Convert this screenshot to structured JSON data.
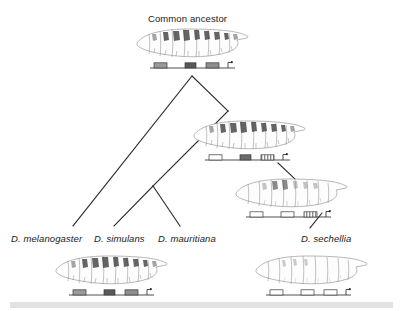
{
  "figure": {
    "kind": "phylogenetic-tree-with-larvae",
    "background_color": "#ffffff",
    "line_color": "#2b2b2b",
    "text_color": "#1a1a1a"
  },
  "title": {
    "text": "Common ancestor",
    "x": 148,
    "y": 14
  },
  "species_labels": [
    {
      "id": "melanogaster",
      "text": "D. melanogaster",
      "x": 11,
      "y": 234
    },
    {
      "id": "simulans",
      "text": "D. simulans",
      "x": 94,
      "y": 234
    },
    {
      "id": "mauritiana",
      "text": "D. mauritiana",
      "x": 158,
      "y": 234
    },
    {
      "id": "sechellia",
      "text": "D. sechellia",
      "x": 301,
      "y": 234
    }
  ],
  "tree": {
    "nodes": {
      "root": {
        "x": 192,
        "y": 76
      },
      "node_right": {
        "x": 228,
        "y": 111
      },
      "node_inner": {
        "x": 153,
        "y": 186
      },
      "tip_mel": {
        "x": 73,
        "y": 226
      },
      "tip_sim": {
        "x": 114,
        "y": 226
      },
      "tip_mau": {
        "x": 180,
        "y": 226
      }
    },
    "branches": [
      {
        "id": "root-to-melanogaster",
        "x1": 192,
        "y1": 76,
        "x2": 73,
        "y2": 226
      },
      {
        "id": "root-to-noderight",
        "x1": 192,
        "y1": 76,
        "x2": 228,
        "y2": 111
      },
      {
        "id": "noderight-to-inner",
        "x1": 228,
        "y1": 111,
        "x2": 153,
        "y2": 186
      },
      {
        "id": "inner-to-simulans",
        "x1": 153,
        "y1": 186,
        "x2": 114,
        "y2": 226
      },
      {
        "id": "inner-to-mauritiana",
        "x1": 153,
        "y1": 186,
        "x2": 180,
        "y2": 226
      },
      {
        "id": "node2-to-node3",
        "x1": 278,
        "y1": 163,
        "x2": 296,
        "y2": 180
      },
      {
        "id": "node3-to-sechellia",
        "x1": 322,
        "y1": 213,
        "x2": 310,
        "y2": 228
      }
    ]
  },
  "larvae": [
    {
      "id": "larva-common-ancestor",
      "position": {
        "x": 133,
        "y": 25,
        "width": 119,
        "height": 34
      },
      "body_tone": "dark-patches",
      "gene_bar": {
        "x": 150,
        "y": 61,
        "width": 85,
        "boxes": [
          {
            "x": 4,
            "w": 13,
            "fill": "solid-gray",
            "color": "#9a9a9a"
          },
          {
            "x": 35,
            "w": 11,
            "fill": "solid-dark",
            "color": "#585858"
          },
          {
            "x": 56,
            "w": 13,
            "fill": "solid-gray",
            "color": "#8e8e8e"
          }
        ],
        "promoter": {
          "x": 78
        }
      }
    },
    {
      "id": "larva-node-right",
      "position": {
        "x": 190,
        "y": 117,
        "width": 119,
        "height": 34
      },
      "body_tone": "dark-patches",
      "gene_bar": {
        "x": 205,
        "y": 153,
        "width": 85,
        "boxes": [
          {
            "x": 4,
            "w": 13,
            "fill": "open",
            "color": "#ffffff"
          },
          {
            "x": 35,
            "w": 11,
            "fill": "solid-dark",
            "color": "#6b6b6b"
          },
          {
            "x": 56,
            "w": 13,
            "fill": "striped",
            "color": "#8e8e8e"
          }
        ],
        "promoter": {
          "x": 78
        }
      }
    },
    {
      "id": "larva-node-sechellia-ancestor",
      "position": {
        "x": 232,
        "y": 175,
        "width": 119,
        "height": 34
      },
      "body_tone": "light-patches",
      "gene_bar": {
        "x": 246,
        "y": 210,
        "width": 85,
        "boxes": [
          {
            "x": 4,
            "w": 13,
            "fill": "open",
            "color": "#ffffff"
          },
          {
            "x": 35,
            "w": 13,
            "fill": "open",
            "color": "#ffffff"
          },
          {
            "x": 58,
            "w": 13,
            "fill": "striped",
            "color": "#9a9a9a"
          }
        ],
        "promoter": {
          "x": 80
        }
      }
    },
    {
      "id": "larva-melanogaster",
      "position": {
        "x": 52,
        "y": 252,
        "width": 119,
        "height": 34
      },
      "body_tone": "dark-patches",
      "gene_bar": {
        "x": 69,
        "y": 288,
        "width": 85,
        "boxes": [
          {
            "x": 4,
            "w": 13,
            "fill": "solid-gray",
            "color": "#9a9a9a"
          },
          {
            "x": 35,
            "w": 11,
            "fill": "solid-dark",
            "color": "#585858"
          },
          {
            "x": 56,
            "w": 13,
            "fill": "solid-gray",
            "color": "#8e8e8e"
          }
        ],
        "promoter": {
          "x": 78
        }
      }
    },
    {
      "id": "larva-sechellia",
      "position": {
        "x": 252,
        "y": 252,
        "width": 119,
        "height": 34
      },
      "body_tone": "very-light",
      "gene_bar": {
        "x": 266,
        "y": 288,
        "width": 85,
        "boxes": [
          {
            "x": 4,
            "w": 13,
            "fill": "open",
            "color": "#ffffff"
          },
          {
            "x": 35,
            "w": 13,
            "fill": "open",
            "color": "#ffffff"
          },
          {
            "x": 58,
            "w": 13,
            "fill": "open",
            "color": "#ffffff"
          }
        ],
        "promoter": {
          "x": 80
        }
      }
    }
  ],
  "footer_band": {
    "color": "#e2e2e2",
    "x": 10,
    "y": 302,
    "width": 383,
    "height": 6
  }
}
